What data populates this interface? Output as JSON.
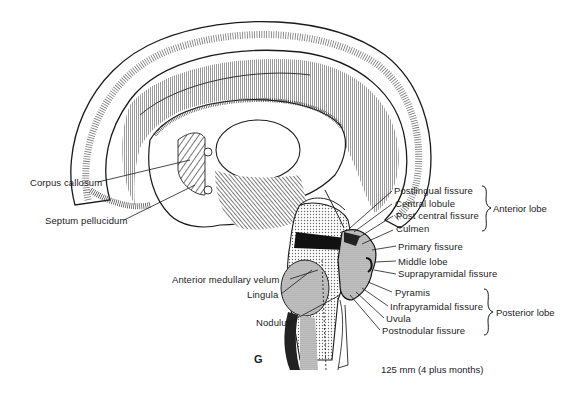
{
  "figure": {
    "panel_letter": "G",
    "caption": "125 mm (4 plus months)",
    "colors": {
      "ink": "#1a1a1a",
      "shade_gray": "#b9b9b9",
      "dark_fill": "#111111",
      "background": "#ffffff"
    }
  },
  "labels_left": [
    {
      "id": "corpus-callosum",
      "text": "Corpus callosum"
    },
    {
      "id": "septum-pellucidum",
      "text": "Septum pellucidum"
    },
    {
      "id": "anterior-medullary-velum",
      "text": "Anterior medullary velum"
    },
    {
      "id": "lingula",
      "text": "Lingula"
    },
    {
      "id": "nodulus",
      "text": "Nodulus"
    }
  ],
  "labels_right": [
    {
      "id": "postlingual-fissure",
      "text": "Postlingual fissure"
    },
    {
      "id": "central-lobule",
      "text": "Central lobule"
    },
    {
      "id": "post-central-fissure",
      "text": "Post central fissure"
    },
    {
      "id": "culmen",
      "text": "Culmen"
    },
    {
      "id": "primary-fissure",
      "text": "Primary fissure"
    },
    {
      "id": "middle-lobe",
      "text": "Middle lobe"
    },
    {
      "id": "suprapyramidal-fissure",
      "text": "Suprapyramidal fissure"
    },
    {
      "id": "pyramis",
      "text": "Pyramis"
    },
    {
      "id": "infrapyramidal-fissure",
      "text": "Infrapyramidal fissure"
    },
    {
      "id": "uvula",
      "text": "Uvula"
    },
    {
      "id": "postnodular-fissure",
      "text": "Postnodular fissure"
    }
  ],
  "groups": [
    {
      "id": "anterior-lobe",
      "text": "Anterior lobe"
    },
    {
      "id": "posterior-lobe",
      "text": "Posterior lobe"
    }
  ]
}
